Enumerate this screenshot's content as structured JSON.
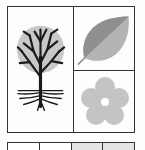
{
  "diagram": {
    "panels": [
      {
        "id": "tree",
        "icon": "tree-with-roots-icon",
        "fill": "#c8c8c8",
        "stroke": "#1a1a1a"
      },
      {
        "id": "leaf",
        "icon": "leaf-icon",
        "fill_dark": "#8f8f8f",
        "fill_light": "#b4b4b4"
      },
      {
        "id": "flower",
        "icon": "flower-icon",
        "fill": "#c4c4c4",
        "center": "#ffffff"
      }
    ],
    "bottom_row": {
      "cells": [
        {
          "fill": "#ffffff"
        },
        {
          "fill": "#ffffff"
        },
        {
          "fill": "#e4e4e4"
        },
        {
          "fill": "#e4e4e4"
        }
      ]
    },
    "colors": {
      "border": "#333333",
      "background": "#fdfdfd"
    }
  }
}
